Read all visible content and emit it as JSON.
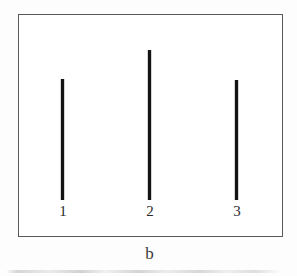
{
  "figure": {
    "caption": "b",
    "background_color": "#ffffff",
    "frame_color": "#5a5a5e",
    "bar_color": "#141414"
  },
  "chart_data": {
    "type": "bar",
    "title": "",
    "subtitle": "",
    "xlabel": "",
    "ylabel": "",
    "categories": [
      "1",
      "2",
      "3"
    ],
    "values": [
      121,
      150,
      120
    ],
    "ylim": [
      0,
      187
    ],
    "grid": false,
    "legend": null,
    "annotations": [
      "b"
    ],
    "bars": [
      {
        "label": "1",
        "value": 121,
        "x_center": 63,
        "top": 79,
        "bottom": 200,
        "width": 3
      },
      {
        "label": "2",
        "value": 150,
        "x_center": 150,
        "top": 50,
        "bottom": 200,
        "width": 3
      },
      {
        "label": "3",
        "value": 120,
        "x_center": 237,
        "top": 80,
        "bottom": 200,
        "width": 3
      }
    ]
  }
}
